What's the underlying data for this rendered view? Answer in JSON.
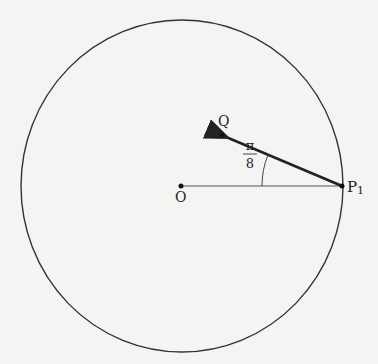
{
  "diagram": {
    "circle": {
      "cx": 182,
      "cy": 186,
      "rx": 161,
      "ry": 166,
      "stroke": "#333333"
    },
    "points": {
      "O": {
        "label": "O",
        "x": 181,
        "y": 186
      },
      "P1": {
        "label": "P",
        "subscript": "1",
        "x": 342,
        "y": 186
      },
      "Q": {
        "label": "Q",
        "x": 222,
        "y": 135
      }
    },
    "angle": {
      "numerator": "π",
      "denominator": "8",
      "vertex": "P1"
    },
    "colors": {
      "background": "#f4f4f3",
      "line": "#222222",
      "thin_line": "#555555"
    }
  }
}
